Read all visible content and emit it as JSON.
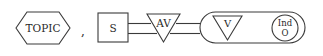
{
  "diagram": {
    "topic": {
      "label": "TOPIC"
    },
    "separator": ",",
    "subject": {
      "label": "S"
    },
    "aux_verb": {
      "label": "AV"
    },
    "verb": {
      "label": "V"
    },
    "indirect_object": {
      "line1": "Ind",
      "line2": "O"
    },
    "colors": {
      "stroke": "#3a3a3a",
      "text": "#2a2a2a",
      "background": "#ffffff"
    }
  }
}
